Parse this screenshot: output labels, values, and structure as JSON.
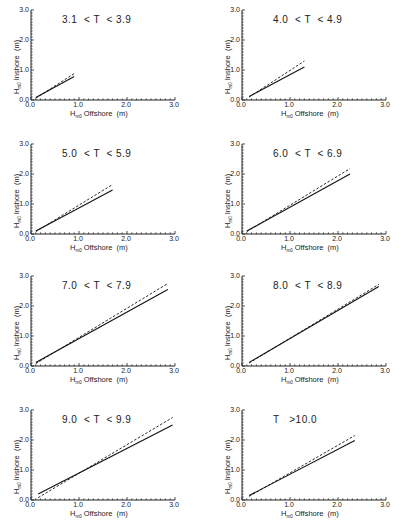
{
  "figure": {
    "xlabel_main": "H",
    "xlabel_sub": "m0",
    "xlabel_rest": " Offshore  (m)",
    "ylabel_main": "H",
    "ylabel_sub": "m0",
    "ylabel_rest": " Inshore  (m)",
    "ticks": [
      "0.0",
      "1.0",
      "2.0",
      "3.0"
    ]
  },
  "chart_data": [
    {
      "type": "line",
      "title": "3.1  < T  < 3.9",
      "xlabel": "Hm0 Offshore (m)",
      "ylabel": "Hm0 Inshore (m)",
      "xlim": [
        0,
        3
      ],
      "ylim": [
        0,
        3
      ],
      "series": [
        {
          "name": "solid",
          "x": [
            0.1,
            0.9
          ],
          "y": [
            0.08,
            0.78
          ]
        },
        {
          "name": "dashed",
          "x": [
            0.1,
            0.9
          ],
          "y": [
            0.06,
            0.88
          ]
        }
      ]
    },
    {
      "type": "line",
      "title": "4.0  < T  < 4.9",
      "xlabel": "Hm0 Offshore (m)",
      "ylabel": "Hm0 Inshore (m)",
      "xlim": [
        0,
        3
      ],
      "ylim": [
        0,
        3
      ],
      "series": [
        {
          "name": "solid",
          "x": [
            0.15,
            1.3
          ],
          "y": [
            0.12,
            1.1
          ]
        },
        {
          "name": "dashed",
          "x": [
            0.15,
            1.3
          ],
          "y": [
            0.1,
            1.3
          ]
        }
      ]
    },
    {
      "type": "line",
      "title": "5.0  < T  < 5.9",
      "xlabel": "Hm0 Offshore (m)",
      "ylabel": "Hm0 Inshore (m)",
      "xlim": [
        0,
        3
      ],
      "ylim": [
        0,
        3
      ],
      "series": [
        {
          "name": "solid",
          "x": [
            0.1,
            1.7
          ],
          "y": [
            0.1,
            1.47
          ]
        },
        {
          "name": "dashed",
          "x": [
            0.1,
            1.7
          ],
          "y": [
            0.08,
            1.65
          ]
        }
      ]
    },
    {
      "type": "line",
      "title": "6.0  < T  < 6.9",
      "xlabel": "Hm0 Offshore (m)",
      "ylabel": "Hm0 Inshore (m)",
      "xlim": [
        0,
        3
      ],
      "ylim": [
        0,
        3
      ],
      "series": [
        {
          "name": "solid",
          "x": [
            0.1,
            2.25
          ],
          "y": [
            0.1,
            2.0
          ]
        },
        {
          "name": "dashed",
          "x": [
            0.1,
            2.25
          ],
          "y": [
            0.08,
            2.18
          ]
        }
      ]
    },
    {
      "type": "line",
      "title": "7.0  < T  < 7.9",
      "xlabel": "Hm0 Offshore (m)",
      "ylabel": "Hm0 Inshore (m)",
      "xlim": [
        0,
        3
      ],
      "ylim": [
        0,
        3
      ],
      "series": [
        {
          "name": "solid",
          "x": [
            0.1,
            2.85
          ],
          "y": [
            0.12,
            2.55
          ]
        },
        {
          "name": "dashed",
          "x": [
            0.1,
            2.85
          ],
          "y": [
            0.08,
            2.75
          ]
        }
      ]
    },
    {
      "type": "line",
      "title": "8.0  < T  < 8.9",
      "xlabel": "Hm0 Offshore (m)",
      "ylabel": "Hm0 Inshore (m)",
      "xlim": [
        0,
        3
      ],
      "ylim": [
        0,
        3
      ],
      "series": [
        {
          "name": "solid",
          "x": [
            0.15,
            2.85
          ],
          "y": [
            0.12,
            2.65
          ]
        },
        {
          "name": "dashed",
          "x": [
            0.15,
            2.85
          ],
          "y": [
            0.1,
            2.72
          ]
        }
      ]
    },
    {
      "type": "line",
      "title": "9.0  < T  < 9.9",
      "xlabel": "Hm0 Offshore (m)",
      "ylabel": "Hm0 Inshore (m)",
      "xlim": [
        0,
        3
      ],
      "ylim": [
        0,
        3
      ],
      "series": [
        {
          "name": "solid",
          "x": [
            0.15,
            2.95
          ],
          "y": [
            0.2,
            2.5
          ]
        },
        {
          "name": "dashed",
          "x": [
            0.15,
            2.95
          ],
          "y": [
            0.08,
            2.75
          ]
        }
      ]
    },
    {
      "type": "line",
      "title": "T   >10.0",
      "xlabel": "Hm0 Offshore (m)",
      "ylabel": "Hm0 Inshore (m)",
      "xlim": [
        0,
        3
      ],
      "ylim": [
        0,
        3
      ],
      "series": [
        {
          "name": "solid",
          "x": [
            0.15,
            2.35
          ],
          "y": [
            0.15,
            1.98
          ]
        },
        {
          "name": "dashed",
          "x": [
            0.15,
            2.35
          ],
          "y": [
            0.12,
            2.15
          ]
        }
      ]
    }
  ]
}
